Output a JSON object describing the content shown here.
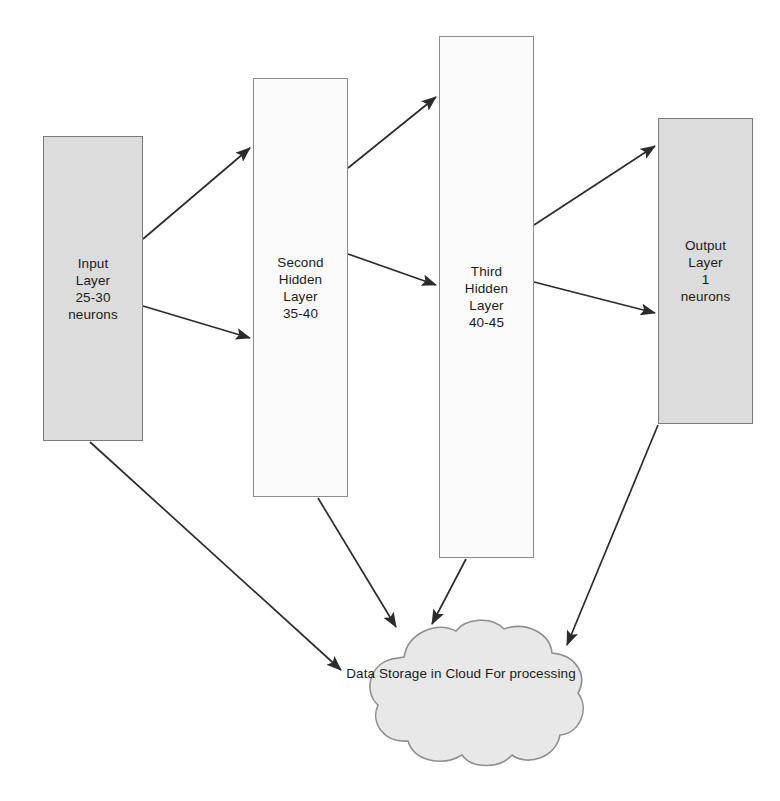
{
  "diagram": {
    "type": "flow-diagram",
    "background_color": "#ffffff",
    "palette": {
      "shaded_box_fill": "#dcdcdc",
      "plain_box_fill": "#fbfbfb",
      "box_border": "#808080",
      "cloud_fill": "#e8e8e8",
      "cloud_border": "#8f8f8f",
      "edge_color": "#2b2b2b",
      "text_color": "#1a1a1a"
    },
    "nodes": [
      {
        "id": "input-layer",
        "shape": "rectangle",
        "style": "shaded",
        "x": 43,
        "y": 136,
        "w": 100,
        "h": 305,
        "lines": [
          "Input",
          "Layer",
          "25-30",
          "neurons"
        ]
      },
      {
        "id": "second-hidden-layer",
        "shape": "rectangle",
        "style": "plain",
        "x": 253,
        "y": 78,
        "w": 95,
        "h": 419,
        "lines": [
          "Second",
          "Hidden",
          "Layer",
          "35-40"
        ]
      },
      {
        "id": "third-hidden-layer",
        "shape": "rectangle",
        "style": "plain",
        "x": 439,
        "y": 36,
        "w": 95,
        "h": 522,
        "lines": [
          "Third",
          "Hidden",
          "Layer",
          "40-45"
        ]
      },
      {
        "id": "output-layer",
        "shape": "rectangle",
        "style": "shaded",
        "x": 658,
        "y": 118,
        "w": 95,
        "h": 306,
        "lines": [
          "Output",
          "Layer",
          "1",
          "neurons"
        ]
      },
      {
        "id": "cloud-storage",
        "shape": "cloud",
        "x": 330,
        "y": 617,
        "w": 262,
        "h": 154,
        "lines": [
          "Data Storage in Cloud For",
          "processing"
        ]
      }
    ],
    "edges": [
      {
        "id": "edge-input-to-second-upper",
        "from": "input-layer",
        "to": "second-hidden-layer",
        "x1": 143,
        "y1": 239,
        "x2": 250,
        "y2": 148
      },
      {
        "id": "edge-input-to-second-lower",
        "from": "input-layer",
        "to": "second-hidden-layer",
        "x1": 143,
        "y1": 306,
        "x2": 250,
        "y2": 338
      },
      {
        "id": "edge-second-to-third-upper",
        "from": "second-hidden-layer",
        "to": "third-hidden-layer",
        "x1": 348,
        "y1": 168,
        "x2": 436,
        "y2": 97
      },
      {
        "id": "edge-second-to-third-lower",
        "from": "second-hidden-layer",
        "to": "third-hidden-layer",
        "x1": 348,
        "y1": 254,
        "x2": 436,
        "y2": 285
      },
      {
        "id": "edge-third-to-output-upper",
        "from": "third-hidden-layer",
        "to": "output-layer",
        "x1": 534,
        "y1": 225,
        "x2": 655,
        "y2": 146
      },
      {
        "id": "edge-third-to-output-lower",
        "from": "third-hidden-layer",
        "to": "output-layer",
        "x1": 534,
        "y1": 282,
        "x2": 655,
        "y2": 313
      },
      {
        "id": "edge-input-to-cloud",
        "from": "input-layer",
        "to": "cloud-storage",
        "x1": 90,
        "y1": 442,
        "x2": 341,
        "y2": 670
      },
      {
        "id": "edge-second-to-cloud",
        "from": "second-hidden-layer",
        "to": "cloud-storage",
        "x1": 318,
        "y1": 498,
        "x2": 396,
        "y2": 627
      },
      {
        "id": "edge-third-to-cloud",
        "from": "third-hidden-layer",
        "to": "cloud-storage",
        "x1": 466,
        "y1": 559,
        "x2": 432,
        "y2": 624
      },
      {
        "id": "edge-output-to-cloud",
        "from": "output-layer",
        "to": "cloud-storage",
        "x1": 658,
        "y1": 425,
        "x2": 567,
        "y2": 645
      }
    ]
  }
}
